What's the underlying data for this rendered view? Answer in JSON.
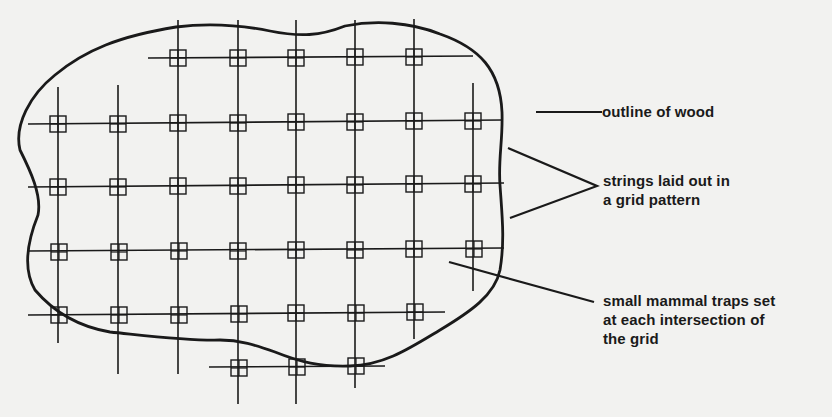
{
  "diagram": {
    "title": "",
    "colors": {
      "ink": "#1a1a1a",
      "paper": "#f2f2f0"
    },
    "labels": {
      "outline": "outline of wood",
      "strings_line1": "strings laid out in",
      "strings_line2": "a grid pattern",
      "traps_line1": "small mammal traps set",
      "traps_line2": "at each intersection of",
      "traps_line3": "the grid"
    },
    "grid": {
      "columns_x": [
        58,
        118,
        178,
        238,
        296,
        355,
        414,
        473
      ],
      "rows": [
        {
          "y": 58,
          "x_from": 148,
          "x_to": 473,
          "trap_cols": [
            2,
            3,
            4,
            5,
            6
          ]
        },
        {
          "y": 122,
          "x_from": 28,
          "x_to": 502,
          "trap_cols": [
            0,
            1,
            2,
            3,
            4,
            5,
            6,
            7
          ]
        },
        {
          "y": 185,
          "x_from": 28,
          "x_to": 504,
          "trap_cols": [
            0,
            1,
            2,
            3,
            4,
            5,
            6,
            7
          ]
        },
        {
          "y": 250,
          "x_from": 28,
          "x_to": 504,
          "trap_cols": [
            0,
            1,
            2,
            3,
            4,
            5,
            6,
            7
          ]
        },
        {
          "y": 314,
          "x_from": 28,
          "x_to": 445,
          "trap_cols": [
            0,
            1,
            2,
            3,
            4,
            5,
            6
          ]
        },
        {
          "y": 366,
          "x_from": 209,
          "x_to": 385,
          "trap_cols": [
            3,
            4,
            5
          ]
        }
      ]
    }
  }
}
